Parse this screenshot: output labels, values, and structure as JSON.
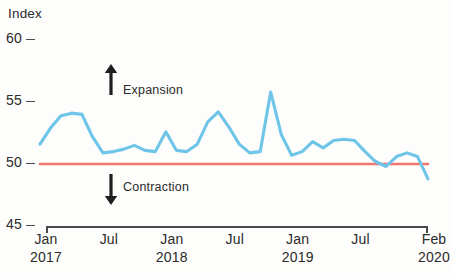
{
  "axis_title": "Index",
  "y_ticks": [
    {
      "label": "60",
      "value": 60
    },
    {
      "label": "55",
      "value": 55
    },
    {
      "label": "50",
      "value": 50
    },
    {
      "label": "45",
      "value": 45
    }
  ],
  "x_labels": [
    {
      "month": "Jan",
      "year": "2017"
    },
    {
      "month": "Jul",
      "year": ""
    },
    {
      "month": "Jan",
      "year": "2018"
    },
    {
      "month": "Jul",
      "year": ""
    },
    {
      "month": "Jan",
      "year": "2019"
    },
    {
      "month": "Jul",
      "year": ""
    },
    {
      "month": "Feb",
      "year": "2020"
    }
  ],
  "annotations": {
    "expansion": "Expansion",
    "contraction": "Contraction",
    "up_arrow_icon": "arrow-up-icon",
    "down_arrow_icon": "arrow-down-icon"
  },
  "colors": {
    "series_line": "#6FC5E8",
    "threshold_line": "#F2776B",
    "axis": "#4a4a4a",
    "text": "#2b2b2b",
    "background": "#fdfdfb"
  },
  "chart_data": {
    "type": "line",
    "title": "",
    "subtitle": "",
    "xlabel": "",
    "ylabel": "Index",
    "ylim": [
      45,
      60
    ],
    "yticks": [
      45,
      50,
      55,
      60
    ],
    "grid": false,
    "legend": null,
    "threshold": {
      "value": 50,
      "label": "",
      "color": "#F2776B"
    },
    "annotations": [
      {
        "text": "Expansion",
        "direction": "up",
        "region": "above-50"
      },
      {
        "text": "Contraction",
        "direction": "down",
        "region": "below-50"
      }
    ],
    "x": [
      "Jan 2017",
      "Feb 2017",
      "Mar 2017",
      "Apr 2017",
      "May 2017",
      "Jun 2017",
      "Jul 2017",
      "Aug 2017",
      "Sep 2017",
      "Oct 2017",
      "Nov 2017",
      "Dec 2017",
      "Jan 2018",
      "Feb 2018",
      "Mar 2018",
      "Apr 2018",
      "May 2018",
      "Jun 2018",
      "Jul 2018",
      "Aug 2018",
      "Sep 2018",
      "Oct 2018",
      "Nov 2018",
      "Dec 2018",
      "Jan 2019",
      "Feb 2019",
      "Mar 2019",
      "Apr 2019",
      "May 2019",
      "Jun 2019",
      "Jul 2019",
      "Aug 2019",
      "Sep 2019",
      "Oct 2019",
      "Nov 2019",
      "Dec 2019",
      "Jan 2020",
      "Feb 2020"
    ],
    "series": [
      {
        "name": "Index",
        "color": "#6FC5E8",
        "values": [
          51.6,
          52.9,
          53.9,
          54.1,
          54.0,
          52.2,
          50.9,
          51.0,
          51.2,
          51.5,
          51.1,
          51.0,
          52.6,
          51.1,
          51.0,
          51.6,
          53.4,
          54.2,
          53.0,
          51.6,
          50.9,
          51.0,
          55.8,
          52.4,
          50.7,
          51.0,
          51.8,
          51.3,
          51.9,
          52.0,
          51.9,
          51.0,
          50.2,
          49.8,
          50.6,
          50.9,
          50.6,
          48.8
        ]
      }
    ]
  }
}
